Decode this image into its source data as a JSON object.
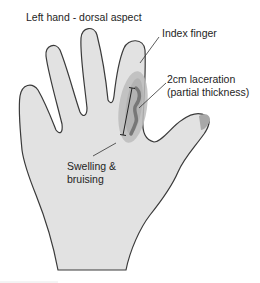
{
  "diagram": {
    "title": "Left hand - dorsal aspect",
    "labels": {
      "index_finger": "Index finger",
      "laceration_line1": "2cm laceration",
      "laceration_line2": "(partial thickness)",
      "swelling_line1": "Swelling &",
      "swelling_line2": "bruising"
    },
    "colors": {
      "skin_fill": "#e2e2e2",
      "outline": "#3a3a3a",
      "bruise_outer": "#b8b8b8",
      "bruise_inner": "#a9a9a9",
      "laceration": "#7a7a7a",
      "nail": "#a8a8a8",
      "text": "#1e1e1e"
    }
  }
}
